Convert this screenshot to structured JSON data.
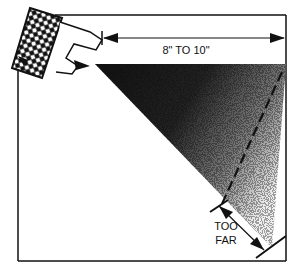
{
  "diagram": {
    "distance_label": "8\" TO 10\"",
    "too_far_label_line1": "TOO",
    "too_far_label_line2": "FAR",
    "colors": {
      "ink": "#111111",
      "paper": "#ffffff"
    },
    "elements": [
      "spray-nozzle",
      "spray-cone",
      "distance-dimension-arrow",
      "optimal-limit-dashed-line",
      "too-far-dimension-arrow",
      "surface-box"
    ]
  }
}
